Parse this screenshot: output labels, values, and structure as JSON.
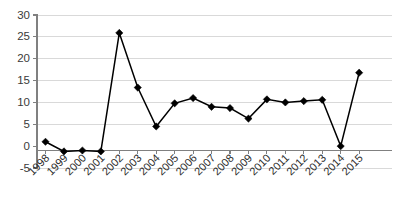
{
  "chart_data": {
    "type": "line",
    "title": "",
    "subtitle": "",
    "xlabel": "",
    "ylabel": "",
    "categories": [
      "1998",
      "1999",
      "2000",
      "2001",
      "2002",
      "2003",
      "2004",
      "2005",
      "2006",
      "2007",
      "2008",
      "2009",
      "2010",
      "2011",
      "2012",
      "2013",
      "2014",
      "2015"
    ],
    "values": [
      1.0,
      -1.2,
      -1.0,
      -1.2,
      25.9,
      13.4,
      4.5,
      9.8,
      11.0,
      9.0,
      8.7,
      6.3,
      10.7,
      10.0,
      10.3,
      10.6,
      0.0,
      16.8
    ],
    "series": [
      {
        "name": "",
        "values": [
          1.0,
          -1.2,
          -1.0,
          -1.2,
          25.9,
          13.4,
          4.5,
          9.8,
          11.0,
          9.0,
          8.7,
          6.3,
          10.7,
          10.0,
          10.3,
          10.6,
          0.0,
          16.8
        ]
      }
    ],
    "ylim": [
      -5,
      30
    ],
    "ytick_values": [
      -5,
      0,
      5,
      10,
      15,
      20,
      25,
      30
    ],
    "ytick_labels": [
      "-5",
      "0",
      "5",
      "10",
      "15",
      "20",
      "25",
      "30"
    ],
    "xtick_labels": [
      "1998",
      "1999",
      "2000",
      "2001",
      "2002",
      "2003",
      "2004",
      "2005",
      "2006",
      "2007",
      "2008",
      "2009",
      "2010",
      "2011",
      "2012",
      "2013",
      "2014",
      "2015"
    ],
    "xtick_label_rotation": 45,
    "grid": true,
    "grid_axis": "y",
    "legend": false,
    "legend_position": "none",
    "marker": "diamond",
    "line_color": "#000000",
    "marker_color": "#000000",
    "grid_color": "#d9d9d9",
    "axis_color": "#808080",
    "background_color": "#ffffff"
  }
}
